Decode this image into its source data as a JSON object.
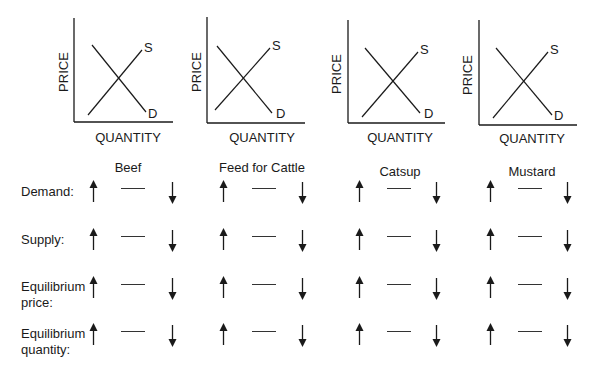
{
  "graphs": [
    {
      "id": "beef",
      "y_axis_label": "PRICE",
      "x_axis_label": "QUANTITY",
      "supply_label": "S",
      "demand_label": "D",
      "axis": {
        "x": 74,
        "top": 18,
        "bottom": 122,
        "right": 173
      },
      "demand_line": [
        [
          92,
          45
        ],
        [
          146,
          112
        ]
      ],
      "supply_line": [
        [
          88,
          115
        ],
        [
          142,
          50
        ]
      ],
      "s_pos": [
        144,
        52
      ],
      "d_pos": [
        148,
        118
      ],
      "qty_pos": [
        128,
        142
      ],
      "price_pos": [
        68,
        72
      ]
    },
    {
      "id": "feed-for-cattle",
      "y_axis_label": "PRICE",
      "x_axis_label": "QUANTITY",
      "supply_label": "S",
      "demand_label": "D",
      "axis": {
        "x": 207,
        "top": 17,
        "bottom": 123,
        "right": 305
      },
      "demand_line": [
        [
          217,
          46
        ],
        [
          272,
          113
        ]
      ],
      "supply_line": [
        [
          215,
          110
        ],
        [
          270,
          48
        ]
      ],
      "s_pos": [
        272,
        50
      ],
      "d_pos": [
        276,
        118
      ],
      "qty_pos": [
        262,
        142
      ],
      "price_pos": [
        201,
        72
      ]
    },
    {
      "id": "catsup",
      "y_axis_label": "PRICE",
      "x_axis_label": "QUANTITY",
      "supply_label": "S",
      "demand_label": "D",
      "axis": {
        "x": 348,
        "top": 20,
        "bottom": 123,
        "right": 445
      },
      "demand_line": [
        [
          365,
          48
        ],
        [
          420,
          113
        ]
      ],
      "supply_line": [
        [
          362,
          117
        ],
        [
          418,
          52
        ]
      ],
      "s_pos": [
        420,
        54
      ],
      "d_pos": [
        424,
        118
      ],
      "qty_pos": [
        400,
        142
      ],
      "price_pos": [
        341,
        74
      ]
    },
    {
      "id": "mustard",
      "y_axis_label": "PRICE",
      "x_axis_label": "QUANTITY",
      "supply_label": "S",
      "demand_label": "D",
      "axis": {
        "x": 479,
        "top": 20,
        "bottom": 125,
        "right": 577
      },
      "demand_line": [
        [
          496,
          48
        ],
        [
          552,
          115
        ]
      ],
      "supply_line": [
        [
          493,
          118
        ],
        [
          548,
          52
        ]
      ],
      "s_pos": [
        550,
        54
      ],
      "d_pos": [
        554,
        120
      ],
      "qty_pos": [
        532,
        143
      ],
      "price_pos": [
        472,
        75
      ]
    }
  ],
  "columns": [
    {
      "label": "Beef",
      "header_x": 128,
      "header_y": 161,
      "up_x": 93,
      "dash_x": 121,
      "down_x": 172
    },
    {
      "label": "Feed for Cattle",
      "header_x": 262,
      "header_y": 161,
      "up_x": 223,
      "dash_x": 252,
      "down_x": 302
    },
    {
      "label": "Catsup",
      "header_x": 400,
      "header_y": 165,
      "up_x": 359,
      "dash_x": 387,
      "down_x": 436
    },
    {
      "label": "Mustard",
      "header_x": 532,
      "header_y": 165,
      "up_x": 490,
      "dash_x": 518,
      "down_x": 567
    }
  ],
  "rows": [
    {
      "label_line1": "Demand:",
      "label_line2": "",
      "label_top": 184,
      "arrow_center_y": 191
    },
    {
      "label_line1": "Supply:",
      "label_line2": "",
      "label_top": 232,
      "arrow_center_y": 239
    },
    {
      "label_line1": "Equilibrium",
      "label_line2": "price:",
      "label_top": 279,
      "arrow_center_y": 287
    },
    {
      "label_line1": "Equilibrium",
      "label_line2": "quantity:",
      "label_top": 326,
      "arrow_center_y": 334
    }
  ],
  "choice_symbols": {
    "increase": "up-arrow",
    "no-change": "dash",
    "decrease": "down-arrow"
  },
  "colors": {
    "ink": "#1a1a1a",
    "background": "#ffffff"
  }
}
